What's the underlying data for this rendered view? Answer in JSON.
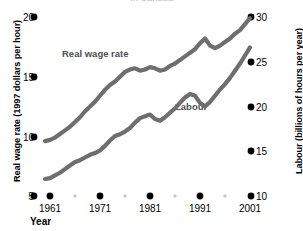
{
  "chart_data": {
    "type": "line",
    "title": "in Canada",
    "xlabel": "Year",
    "left_axis": {
      "label": "Real wage rate (1997 dollars per hour)",
      "ticks": [
        20,
        15,
        10,
        5
      ],
      "range": [
        5,
        20
      ]
    },
    "right_axis": {
      "label": "Labour (billions of hours per year)",
      "ticks": [
        30,
        25,
        20,
        15,
        10
      ],
      "range": [
        10,
        30
      ]
    },
    "x_ticks": [
      "1961",
      "1971",
      "1981",
      "1991",
      "2001"
    ],
    "x_minor_ticks": [
      "1966",
      "1976",
      "1986",
      "1996"
    ],
    "xlim": [
      1960,
      2002
    ],
    "grid": false,
    "legend_position": "inline-annotation",
    "series": [
      {
        "name": "Real wage rate",
        "axis": "left",
        "color": "#6e6e6e",
        "x": [
          1960,
          1961,
          1962,
          1963,
          1964,
          1965,
          1966,
          1967,
          1968,
          1969,
          1970,
          1971,
          1972,
          1973,
          1974,
          1975,
          1976,
          1977,
          1978,
          1979,
          1980,
          1981,
          1982,
          1983,
          1984,
          1985,
          1986,
          1987,
          1988,
          1989,
          1990,
          1991,
          1992,
          1993,
          1994,
          1995,
          1996,
          1997,
          1998,
          1999,
          2000,
          2001
        ],
        "values": [
          9.6,
          9.7,
          9.9,
          10.2,
          10.5,
          10.8,
          11.2,
          11.6,
          12.1,
          12.5,
          12.9,
          13.4,
          13.9,
          14.3,
          14.6,
          15.0,
          15.4,
          15.6,
          15.7,
          15.5,
          15.6,
          15.8,
          15.7,
          15.5,
          15.6,
          15.9,
          16.1,
          16.4,
          16.7,
          17.0,
          17.3,
          17.8,
          18.2,
          17.6,
          17.4,
          17.6,
          17.9,
          18.2,
          18.6,
          18.9,
          19.4,
          19.9
        ]
      },
      {
        "name": "Labour",
        "axis": "right",
        "color": "#6e6e6e",
        "x": [
          1960,
          1961,
          1962,
          1963,
          1964,
          1965,
          1966,
          1967,
          1968,
          1969,
          1970,
          1971,
          1972,
          1973,
          1974,
          1975,
          1976,
          1977,
          1978,
          1979,
          1980,
          1981,
          1982,
          1983,
          1984,
          1985,
          1986,
          1987,
          1988,
          1989,
          1990,
          1991,
          1992,
          1993,
          1994,
          1995,
          1996,
          1997,
          1998,
          1999,
          2000,
          2001
        ],
        "values": [
          11.9,
          12.0,
          12.3,
          12.6,
          13.0,
          13.4,
          13.8,
          14.0,
          14.3,
          14.6,
          14.8,
          15.1,
          15.6,
          16.2,
          16.7,
          16.9,
          17.2,
          17.6,
          18.2,
          18.7,
          18.9,
          19.1,
          18.6,
          18.4,
          18.8,
          19.3,
          19.8,
          20.4,
          21.0,
          21.4,
          21.2,
          20.4,
          20.0,
          20.5,
          21.2,
          21.9,
          22.5,
          23.2,
          24.0,
          24.8,
          25.7,
          26.6
        ]
      }
    ],
    "annotations": [
      {
        "text": "Real wage rate",
        "x": 1966,
        "y": 17.5
      },
      {
        "text": "Labour",
        "x": 1987,
        "y": 19.5
      }
    ]
  },
  "colors": {
    "series": "#6e6e6e",
    "tick_dot": "#000000",
    "minor_dot": "#c8c8c8",
    "label_text": "#4f4f4f"
  }
}
